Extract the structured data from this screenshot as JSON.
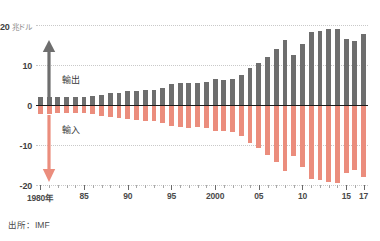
{
  "chart_data": {
    "type": "bar",
    "title": "",
    "subtitle": "",
    "unit_label": "兆ドル",
    "y_axis_top_value": "20",
    "xlabel": "",
    "ylabel": "",
    "ylim": [
      -20,
      20
    ],
    "grid": true,
    "legend_position": "inline-annotations",
    "y_ticks": [
      {
        "value": 20,
        "label": "20",
        "unit": "兆ドル"
      },
      {
        "value": 10,
        "label": "10",
        "unit": ""
      },
      {
        "value": 0,
        "label": "0",
        "unit": ""
      },
      {
        "value": -10,
        "label": "-10",
        "unit": ""
      },
      {
        "value": -20,
        "label": "-20",
        "unit": ""
      }
    ],
    "x_tick_labels": [
      {
        "year": 1980,
        "label": "1980年"
      },
      {
        "year": 1985,
        "label": "85"
      },
      {
        "year": 1990,
        "label": "90"
      },
      {
        "year": 1995,
        "label": "95"
      },
      {
        "year": 2000,
        "label": "2000"
      },
      {
        "year": 2005,
        "label": "05"
      },
      {
        "year": 2010,
        "label": "10"
      },
      {
        "year": 2015,
        "label": "15"
      },
      {
        "year": 2017,
        "label": "17"
      }
    ],
    "categories": [
      1980,
      1981,
      1982,
      1983,
      1984,
      1985,
      1986,
      1987,
      1988,
      1989,
      1990,
      1991,
      1992,
      1993,
      1994,
      1995,
      1996,
      1997,
      1998,
      1999,
      2000,
      2001,
      2002,
      2003,
      2004,
      2005,
      2006,
      2007,
      2008,
      2009,
      2010,
      2011,
      2012,
      2013,
      2014,
      2015,
      2016,
      2017
    ],
    "series": [
      {
        "name": "輸出",
        "color": "#6e6e6e",
        "values": [
          2.1,
          2.1,
          1.9,
          1.9,
          2.0,
          2.0,
          2.2,
          2.6,
          2.9,
          3.1,
          3.5,
          3.6,
          3.8,
          3.8,
          4.3,
          5.2,
          5.4,
          5.6,
          5.5,
          5.7,
          6.4,
          6.2,
          6.5,
          7.6,
          9.2,
          10.5,
          12.1,
          14.0,
          16.2,
          12.6,
          15.3,
          18.3,
          18.5,
          18.9,
          19.1,
          16.6,
          16.1,
          17.7
        ]
      },
      {
        "name": "輸入",
        "color": "#eb8d7d",
        "values": [
          -2.2,
          -2.2,
          -2.0,
          -1.9,
          -2.1,
          -2.1,
          -2.3,
          -2.7,
          -3.0,
          -3.2,
          -3.6,
          -3.7,
          -3.9,
          -3.9,
          -4.4,
          -5.3,
          -5.5,
          -5.7,
          -5.6,
          -5.8,
          -6.6,
          -6.4,
          -6.7,
          -7.8,
          -9.4,
          -10.8,
          -12.4,
          -14.3,
          -16.5,
          -12.8,
          -15.6,
          -18.6,
          -18.8,
          -19.2,
          -19.4,
          -16.9,
          -16.3,
          -18.0
        ]
      }
    ],
    "annotations": [
      {
        "name": "export-arrow",
        "label": "輸出",
        "direction": "up",
        "color": "#6e6e6e"
      },
      {
        "name": "import-arrow",
        "label": "輸入",
        "direction": "down",
        "color": "#eb8d7d"
      }
    ],
    "source_note": "出所：IMF"
  }
}
